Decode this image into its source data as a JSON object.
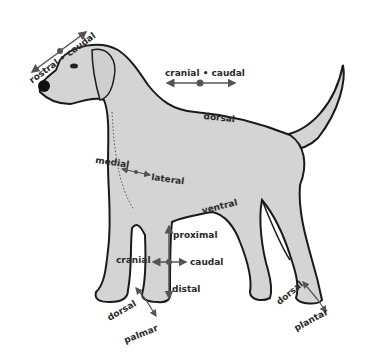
{
  "diagram": {
    "colors": {
      "body_fill": "#d4d4d4",
      "outline": "#1a1a1a",
      "arrow": "#555555",
      "text": "#2a2a2a",
      "background": "#ffffff"
    },
    "labels": {
      "rostral_caudal": "rostral • caudal",
      "cranial_caudal": "cranial • caudal",
      "dorsal_back": "dorsal",
      "medial": "medial",
      "lateral": "lateral",
      "ventral": "ventral",
      "proximal": "proximal",
      "cranial_leg": "cranial",
      "caudal_leg": "caudal",
      "distal": "distal",
      "dorsal_front_paw": "dorsal",
      "palmar": "palmar",
      "dorsal_hind_paw": "dorsal",
      "plantar": "plantar"
    }
  }
}
